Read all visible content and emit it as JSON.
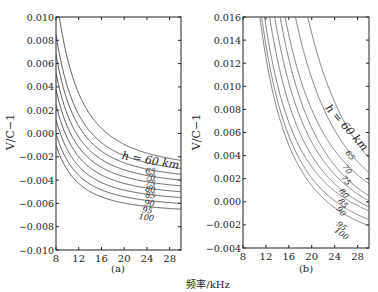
{
  "figure": {
    "shared_xlabel": "频率/kHz",
    "panels": [
      {
        "label": "(a)",
        "ylabel": "V/C−1"
      },
      {
        "label": "(b)",
        "ylabel": "V/C−1"
      }
    ]
  },
  "chart_data": [
    {
      "type": "line",
      "title": "(a)",
      "xlabel": "频率/kHz",
      "ylabel": "V/C−1",
      "xlim": [
        8,
        30
      ],
      "ylim": [
        -0.01,
        0.01
      ],
      "xticks": [
        8,
        12,
        16,
        20,
        24,
        28
      ],
      "yticks": [
        -0.01,
        -0.008,
        -0.006,
        -0.004,
        -0.002,
        0.0,
        0.002,
        0.004,
        0.006,
        0.008,
        0.01
      ],
      "ytick_labels": [
        "−0.010",
        "−0.008",
        "−0.006",
        "−0.004",
        "−0.002",
        "0.000",
        "0.002",
        "0.004",
        "0.006",
        "0.008",
        "0.010"
      ],
      "grid": false,
      "x": [
        8,
        10,
        12,
        14,
        16,
        18,
        20,
        22,
        24,
        26,
        28,
        30
      ],
      "series": [
        {
          "name": "h = 60 km",
          "label": "h = 60 km",
          "values": [
            0.012,
            0.00646,
            0.00344,
            0.00163,
            0.00045,
            -0.00036,
            -0.00093,
            -0.00136,
            -0.00169,
            -0.00194,
            -0.00214,
            -0.0023
          ]
        },
        {
          "name": "65",
          "label": "65",
          "values": [
            0.0085,
            0.00404,
            0.00162,
            0.00016,
            -0.00079,
            -0.00144,
            -0.0019,
            -0.00224,
            -0.0025,
            -0.00271,
            -0.00287,
            -0.003
          ]
        },
        {
          "name": "70",
          "label": "70",
          "values": [
            0.0068,
            0.00281,
            0.00064,
            -0.00067,
            -0.00152,
            -0.0021,
            -0.00251,
            -0.00282,
            -0.00306,
            -0.00324,
            -0.00338,
            -0.0035
          ]
        },
        {
          "name": "75",
          "label": "75",
          "values": [
            0.0052,
            0.00163,
            -0.0003,
            -0.00147,
            -0.00223,
            -0.00275,
            -0.00312,
            -0.00339,
            -0.0036,
            -0.00377,
            -0.0039,
            -0.004
          ]
        },
        {
          "name": "80",
          "label": "80",
          "values": [
            0.0038,
            0.00058,
            -0.00116,
            -0.00222,
            -0.0029,
            -0.00337,
            -0.00371,
            -0.00395,
            -0.00414,
            -0.00429,
            -0.00441,
            -0.0045
          ]
        },
        {
          "name": "85",
          "label": "85",
          "values": [
            0.0025,
            -0.00041,
            -0.00199,
            -0.00294,
            -0.00356,
            -0.00398,
            -0.00428,
            -0.00451,
            -0.00468,
            -0.00481,
            -0.00491,
            -0.005
          ]
        },
        {
          "name": "90",
          "label": "90",
          "values": [
            0.0012,
            -0.0014,
            -0.00281,
            -0.00366,
            -0.00421,
            -0.00459,
            -0.00486,
            -0.00506,
            -0.00521,
            -0.00533,
            -0.00542,
            -0.0055
          ]
        },
        {
          "name": "95",
          "label": "95",
          "values": [
            0.0,
            -0.00233,
            -0.00359,
            -0.00435,
            -0.00484,
            -0.00518,
            -0.00543,
            -0.0056,
            -0.00574,
            -0.00585,
            -0.00593,
            -0.006
          ]
        },
        {
          "name": "100",
          "label": "100",
          "values": [
            -0.001,
            -0.00313,
            -0.00429,
            -0.00499,
            -0.00544,
            -0.00575,
            -0.00597,
            -0.00614,
            -0.00626,
            -0.00636,
            -0.00644,
            -0.0065
          ]
        }
      ]
    },
    {
      "type": "line",
      "title": "(b)",
      "xlabel": "频率/kHz",
      "ylabel": "V/C−1",
      "xlim": [
        8,
        30
      ],
      "ylim": [
        -0.004,
        0.016
      ],
      "xticks": [
        8,
        12,
        16,
        20,
        24,
        28
      ],
      "yticks": [
        -0.004,
        -0.002,
        0.0,
        0.002,
        0.004,
        0.006,
        0.008,
        0.01,
        0.012,
        0.014,
        0.016
      ],
      "ytick_labels": [
        "−0.004",
        "−0.002",
        "0.000",
        "0.002",
        "0.004",
        "0.006",
        "0.008",
        "0.010",
        "0.012",
        "0.014",
        "0.016"
      ],
      "grid": false,
      "x": [
        8,
        10,
        12,
        14,
        16,
        18,
        20,
        22,
        24,
        26,
        28,
        30
      ],
      "series": [
        {
          "name": "h = 60 km",
          "label": "h = 60 km",
          "top_crossing_khz": 19.3,
          "values": [
            null,
            null,
            null,
            null,
            null,
            null,
            0.0146,
            0.0112,
            0.0086,
            0.0066,
            0.0051,
            0.0038
          ]
        },
        {
          "name": "65",
          "label": "65",
          "top_crossing_khz": 16.8,
          "values": [
            null,
            null,
            null,
            null,
            null,
            0.0138,
            0.011,
            0.0083,
            0.0064,
            0.0048,
            0.0034,
            0.0022
          ]
        },
        {
          "name": "70",
          "label": "70",
          "top_crossing_khz": 15.2,
          "values": [
            null,
            null,
            null,
            null,
            0.0141,
            0.0106,
            0.0082,
            0.0064,
            0.0049,
            0.0036,
            0.0021,
            0.0008
          ]
        },
        {
          "name": "75",
          "label": "75",
          "top_crossing_khz": 14.2,
          "values": [
            null,
            null,
            null,
            null,
            0.0119,
            0.0089,
            0.0067,
            0.005,
            0.0036,
            0.0024,
            0.001,
            -0.0004
          ]
        },
        {
          "name": "80",
          "label": "80",
          "top_crossing_khz": 13.3,
          "values": [
            null,
            null,
            null,
            0.0141,
            0.0103,
            0.0077,
            0.0057,
            0.0041,
            0.0028,
            0.0017,
            0.0003,
            -0.0011
          ]
        },
        {
          "name": "85",
          "label": "85",
          "top_crossing_khz": 12.4,
          "values": [
            null,
            null,
            null,
            0.0118,
            0.0085,
            0.0062,
            0.0045,
            0.0032,
            0.002,
            0.001,
            -0.0003,
            -0.0016
          ]
        },
        {
          "name": "90",
          "label": "90",
          "top_crossing_khz": 11.6,
          "values": [
            null,
            null,
            0.0148,
            0.01,
            0.0071,
            0.0051,
            0.0036,
            0.0024,
            0.0013,
            0.0004,
            -0.0008,
            -0.0021
          ]
        },
        {
          "name": "95",
          "label": "95",
          "top_crossing_khz": 11.0,
          "values": [
            null,
            null,
            0.0132,
            0.0086,
            0.0059,
            0.004,
            0.0026,
            0.0015,
            0.0005,
            -0.0004,
            -0.0016,
            -0.0028
          ]
        },
        {
          "name": "100",
          "label": "100",
          "top_crossing_khz": 10.6,
          "values": [
            null,
            null,
            0.0121,
            0.0078,
            0.0051,
            0.0033,
            0.0019,
            0.0008,
            -0.0001,
            -0.001,
            -0.0021,
            -0.0033
          ]
        }
      ]
    }
  ]
}
